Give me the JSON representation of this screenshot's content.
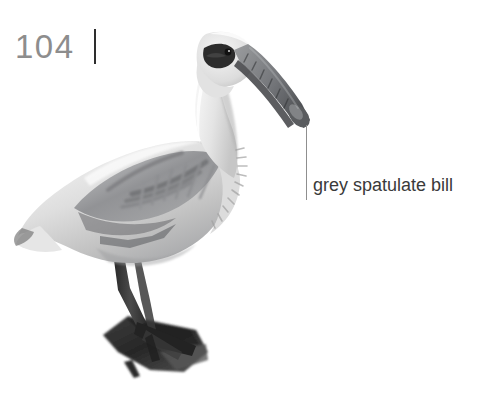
{
  "page": {
    "folio_number": "104",
    "background_color": "#ffffff",
    "folio_color": "#8d8d8d",
    "folio_rule_color": "#2e2e2e"
  },
  "figure": {
    "plumage_color": "#d9d9d9",
    "wing_shadow_color": "#8f9093",
    "leg_color": "#3b3b3b",
    "bill_color": "#6f7174",
    "eye_patch_color": "#2b2b2b"
  },
  "annotation": {
    "label": "grey spatulate bill",
    "label_color": "#3a3a3a",
    "leader_color": "#8f8f8f"
  }
}
